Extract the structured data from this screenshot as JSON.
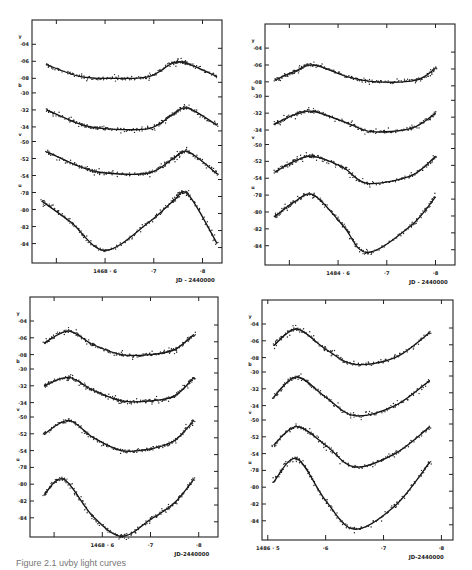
{
  "figure": {
    "caption": "Figure 2.1   uvby light curves"
  },
  "chart_data": [
    {
      "type": "line",
      "panel": "top-left",
      "title": "",
      "box": [
        32,
        20,
        222,
        263
      ],
      "xlabel": "JD - 2440000",
      "x_range": [
        1468.45,
        1468.84
      ],
      "x_ticks": [
        {
          "x": 1468.5,
          "label": ""
        },
        {
          "x": 1468.6,
          "label": "1468 · 6"
        },
        {
          "x": 1468.7,
          "label": "·7"
        },
        {
          "x": 1468.8,
          "label": "·8"
        }
      ],
      "y_ticks_per_band": {
        "y": [
          "·04",
          "·06",
          "·08"
        ],
        "b": [
          "·30",
          "·32",
          "·34"
        ],
        "v": [
          "·50",
          "·52",
          "·54"
        ],
        "u": [
          "·78",
          "·80",
          "·82",
          "·84"
        ]
      },
      "series": [
        {
          "name": "y",
          "x": [
            1468.48,
            1468.55,
            1468.62,
            1468.69,
            1468.74,
            1468.77,
            1468.83
          ],
          "values": [
            0.064,
            0.078,
            0.08,
            0.078,
            0.062,
            0.063,
            0.078
          ]
        },
        {
          "name": "b",
          "x": [
            1468.48,
            1468.55,
            1468.6,
            1468.69,
            1468.74,
            1468.77,
            1468.83
          ],
          "values": [
            0.32,
            0.337,
            0.342,
            0.342,
            0.325,
            0.318,
            0.338
          ]
        },
        {
          "name": "v",
          "x": [
            1468.48,
            1468.55,
            1468.6,
            1468.69,
            1468.74,
            1468.77,
            1468.83
          ],
          "values": [
            0.512,
            0.53,
            0.537,
            0.537,
            0.52,
            0.512,
            0.538
          ]
        },
        {
          "name": "u",
          "x": [
            1468.47,
            1468.53,
            1468.6,
            1468.69,
            1468.74,
            1468.77,
            1468.83
          ],
          "values": [
            0.79,
            0.815,
            0.848,
            0.815,
            0.79,
            0.782,
            0.84
          ]
        }
      ]
    },
    {
      "type": "line",
      "panel": "top-right",
      "title": "",
      "box": [
        265,
        24,
        455,
        265
      ],
      "xlabel": "JD - 2440000",
      "x_range": [
        1484.45,
        1484.84
      ],
      "x_ticks": [
        {
          "x": 1484.5,
          "label": ""
        },
        {
          "x": 1484.6,
          "label": "1484 · 6"
        },
        {
          "x": 1484.7,
          "label": "·7"
        },
        {
          "x": 1484.8,
          "label": "·8"
        }
      ],
      "y_ticks_per_band": {
        "y": [
          "·04",
          "·06",
          "·08"
        ],
        "b": [
          "·30",
          "·32",
          "·34"
        ],
        "v": [
          "·50",
          "·52",
          "·54"
        ],
        "u": [
          "·78",
          "·80",
          "·82",
          "·84"
        ]
      },
      "series": [
        {
          "name": "y",
          "x": [
            1484.47,
            1484.51,
            1484.55,
            1484.62,
            1484.68,
            1484.76,
            1484.8
          ],
          "values": [
            0.078,
            0.068,
            0.06,
            0.074,
            0.08,
            0.078,
            0.064
          ]
        },
        {
          "name": "b",
          "x": [
            1484.47,
            1484.51,
            1484.55,
            1484.62,
            1484.67,
            1484.75,
            1484.8
          ],
          "values": [
            0.333,
            0.322,
            0.318,
            0.332,
            0.342,
            0.338,
            0.32
          ]
        },
        {
          "name": "v",
          "x": [
            1484.47,
            1484.51,
            1484.55,
            1484.61,
            1484.66,
            1484.75,
            1484.8
          ],
          "values": [
            0.533,
            0.52,
            0.514,
            0.527,
            0.546,
            0.537,
            0.514
          ]
        },
        {
          "name": "u",
          "x": [
            1484.47,
            1484.51,
            1484.55,
            1484.61,
            1484.66,
            1484.75,
            1484.8
          ],
          "values": [
            0.806,
            0.788,
            0.78,
            0.816,
            0.848,
            0.816,
            0.782
          ]
        }
      ]
    },
    {
      "type": "line",
      "panel": "bottom-left",
      "title": "",
      "box": [
        30,
        297,
        218,
        537
      ],
      "xlabel": "JD-2440000",
      "x_range": [
        1468.45,
        1468.84
      ],
      "x_ticks": [
        {
          "x": 1468.5,
          "label": ""
        },
        {
          "x": 1468.6,
          "label": "1468 · 6"
        },
        {
          "x": 1468.7,
          "label": "·7"
        },
        {
          "x": 1468.8,
          "label": "·8"
        }
      ],
      "y_ticks_per_band": {
        "y": [
          "·04",
          "·06",
          "·08"
        ],
        "b": [
          "·30",
          "·32",
          "·34"
        ],
        "v": [
          "·50",
          "·52",
          "·54"
        ],
        "u": [
          "·78",
          "·80",
          "·82",
          "·84"
        ]
      },
      "series": [
        {
          "name": "y",
          "x": [
            1468.48,
            1468.53,
            1468.58,
            1468.64,
            1468.7,
            1468.75,
            1468.79
          ],
          "values": [
            0.066,
            0.052,
            0.068,
            0.08,
            0.08,
            0.074,
            0.056
          ]
        },
        {
          "name": "b",
          "x": [
            1468.48,
            1468.53,
            1468.58,
            1468.64,
            1468.7,
            1468.75,
            1468.79
          ],
          "values": [
            0.32,
            0.31,
            0.325,
            0.338,
            0.338,
            0.332,
            0.31
          ]
        },
        {
          "name": "v",
          "x": [
            1468.48,
            1468.53,
            1468.58,
            1468.64,
            1468.7,
            1468.75,
            1468.79
          ],
          "values": [
            0.52,
            0.504,
            0.524,
            0.54,
            0.538,
            0.528,
            0.504
          ]
        },
        {
          "name": "u",
          "x": [
            1468.48,
            1468.52,
            1468.58,
            1468.64,
            1468.7,
            1468.75,
            1468.79
          ],
          "values": [
            0.812,
            0.794,
            0.838,
            0.862,
            0.842,
            0.822,
            0.794
          ]
        }
      ]
    },
    {
      "type": "line",
      "panel": "bottom-right",
      "title": "",
      "box": [
        262,
        300,
        453,
        540
      ],
      "xlabel": "JD-2440000",
      "x_range": [
        1486.49,
        1486.82
      ],
      "x_ticks": [
        {
          "x": 1486.5,
          "label": "1486 · 5"
        },
        {
          "x": 1486.6,
          "label": "·6"
        },
        {
          "x": 1486.7,
          "label": "·7"
        },
        {
          "x": 1486.8,
          "label": "·8"
        }
      ],
      "y_ticks_per_band": {
        "y": [
          "·04",
          "·06",
          "·08"
        ],
        "b": [
          "·30",
          "·32",
          "·34"
        ],
        "v": [
          "·50",
          "·52",
          "·54"
        ],
        "u": [
          "·78",
          "·80",
          "·82",
          "·84"
        ]
      },
      "series": [
        {
          "name": "y",
          "x": [
            1486.51,
            1486.55,
            1486.6,
            1486.65,
            1486.72,
            1486.78
          ],
          "values": [
            0.066,
            0.046,
            0.07,
            0.088,
            0.08,
            0.05
          ]
        },
        {
          "name": "b",
          "x": [
            1486.51,
            1486.55,
            1486.6,
            1486.65,
            1486.72,
            1486.78
          ],
          "values": [
            0.33,
            0.306,
            0.33,
            0.352,
            0.34,
            0.31
          ]
        },
        {
          "name": "v",
          "x": [
            1486.51,
            1486.55,
            1486.6,
            1486.65,
            1486.72,
            1486.78
          ],
          "values": [
            0.53,
            0.508,
            0.53,
            0.556,
            0.54,
            0.508
          ]
        },
        {
          "name": "u",
          "x": [
            1486.51,
            1486.55,
            1486.6,
            1486.65,
            1486.72,
            1486.78
          ],
          "values": [
            0.794,
            0.766,
            0.816,
            0.85,
            0.822,
            0.77
          ]
        }
      ]
    }
  ]
}
